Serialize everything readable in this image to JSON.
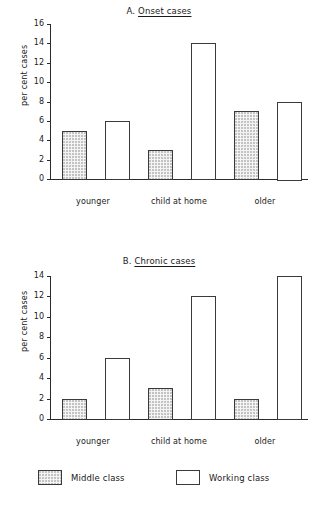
{
  "figure": {
    "panels": [
      {
        "id": "A",
        "prefix": "A.",
        "name": "Onset cases",
        "ylabel": "per cent cases"
      },
      {
        "id": "B",
        "prefix": "B.",
        "name": "Chronic cases",
        "ylabel": "per cent cases"
      }
    ],
    "legend": {
      "items": [
        {
          "label": "Middle class",
          "swatch": "dotted"
        },
        {
          "label": "Working class",
          "swatch": "white"
        }
      ]
    }
  },
  "chart_data": [
    {
      "type": "bar",
      "title": "A. Onset cases",
      "xlabel": "",
      "ylabel": "per cent cases",
      "ylim": [
        0,
        16
      ],
      "yticks": [
        0,
        2,
        4,
        6,
        8,
        10,
        12,
        14,
        16
      ],
      "ytick_labels": [
        "0",
        "2",
        "4",
        "6",
        "8",
        "10",
        "12",
        "14",
        "16"
      ],
      "grid": false,
      "legend_position": "bottom-shared",
      "categories": [
        "younger",
        "child at home",
        "older"
      ],
      "series": [
        {
          "name": "Middle class",
          "values": [
            5,
            3,
            7
          ]
        },
        {
          "name": "Working class",
          "values": [
            6,
            14,
            8
          ]
        }
      ]
    },
    {
      "type": "bar",
      "title": "B. Chronic cases",
      "xlabel": "",
      "ylabel": "per cent cases",
      "ylim": [
        0,
        14
      ],
      "yticks": [
        0,
        2,
        4,
        6,
        8,
        10,
        12,
        14
      ],
      "ytick_labels": [
        "0",
        "2",
        "4",
        "6",
        "8",
        "10",
        "12",
        "14"
      ],
      "grid": false,
      "legend_position": "bottom-shared",
      "categories": [
        "younger",
        "child at home",
        "older"
      ],
      "series": [
        {
          "name": "Middle class",
          "values": [
            2,
            3,
            2
          ]
        },
        {
          "name": "Working class",
          "values": [
            6,
            12,
            14
          ]
        }
      ]
    }
  ]
}
